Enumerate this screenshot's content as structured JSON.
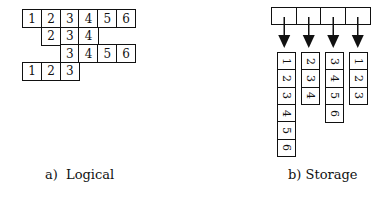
{
  "logical": {
    "caption": "a)  Logical",
    "rows": [
      {
        "start_col": 0,
        "values": [
          "1",
          "2",
          "3",
          "4",
          "5",
          "6"
        ]
      },
      {
        "start_col": 1,
        "values": [
          "2",
          "3",
          "4"
        ]
      },
      {
        "start_col": 2,
        "values": [
          "3",
          "4",
          "5",
          "6"
        ]
      },
      {
        "start_col": 0,
        "values": [
          "1",
          "2",
          "3"
        ]
      }
    ]
  },
  "storage": {
    "caption": "b) Storage",
    "header_cells": 4,
    "columns": [
      {
        "values": [
          "1",
          "2",
          "3",
          "4",
          "5",
          "6"
        ]
      },
      {
        "values": [
          "2",
          "3",
          "4"
        ]
      },
      {
        "values": [
          "3",
          "4",
          "5",
          "6"
        ]
      },
      {
        "values": [
          "1",
          "2",
          "3"
        ]
      }
    ]
  }
}
